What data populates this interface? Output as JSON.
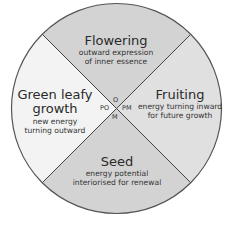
{
  "diagram": {
    "type": "cycle-wheel",
    "center_labels": {
      "top": "O",
      "left": "PO",
      "right": "PM",
      "bottom": "M"
    },
    "segments": [
      {
        "id": "flowering",
        "position": "top",
        "title": "Flowering",
        "subtitle_lines": [
          "outward expression",
          "of inner essence"
        ],
        "fill": "#d3d3d3"
      },
      {
        "id": "fruiting",
        "position": "right",
        "title": "Fruiting",
        "subtitle_lines": [
          "energy turning inward",
          "for future growth"
        ],
        "fill": "#e0e0e0"
      },
      {
        "id": "seed",
        "position": "bottom",
        "title": "Seed",
        "subtitle_lines": [
          "energy potential",
          "interiorised for renewal"
        ],
        "fill": "#d3d3d3"
      },
      {
        "id": "green-leafy-growth",
        "position": "left",
        "title_lines": [
          "Green leafy",
          "growth"
        ],
        "subtitle_lines": [
          "new energy",
          "turning outward"
        ],
        "fill": "#f3f3f3"
      }
    ],
    "outline_color": "#555555"
  }
}
